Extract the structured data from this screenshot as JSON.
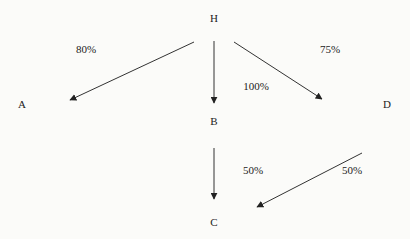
{
  "diagram": {
    "nodes": [
      {
        "id": "H",
        "label": "H"
      },
      {
        "id": "A",
        "label": "A"
      },
      {
        "id": "B",
        "label": "B"
      },
      {
        "id": "D",
        "label": "D"
      },
      {
        "id": "C",
        "label": "C"
      }
    ],
    "edges": [
      {
        "from": "H",
        "to": "A",
        "label": "80%"
      },
      {
        "from": "H",
        "to": "B",
        "label": "100%"
      },
      {
        "from": "H",
        "to": "D",
        "label": "75%"
      },
      {
        "from": "B",
        "to": "C",
        "label": "50%"
      },
      {
        "from": "D",
        "to": "C",
        "label": "50%"
      }
    ],
    "colors": {
      "line": "#333333",
      "text": "#222222",
      "background": "#fbfbf9"
    }
  }
}
